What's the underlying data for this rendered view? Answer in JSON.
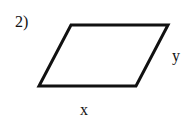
{
  "problem": {
    "number": "2)",
    "shape": "parallelogram",
    "labels": {
      "side_bottom": "x",
      "side_right": "y"
    }
  },
  "colors": {
    "stroke": "#111111",
    "background": "#ffffff"
  }
}
